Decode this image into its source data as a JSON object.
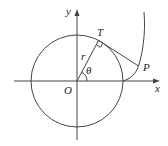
{
  "figure": {
    "type": "involute of a circle",
    "labels": {
      "y_axis": "y",
      "x_axis": "x",
      "origin": "O",
      "tangent_point": "T",
      "curve_point": "P",
      "radius": "r",
      "angle": "θ"
    },
    "colors": {
      "line": "#444444",
      "text": "#222222",
      "background": "#ffffff"
    }
  }
}
